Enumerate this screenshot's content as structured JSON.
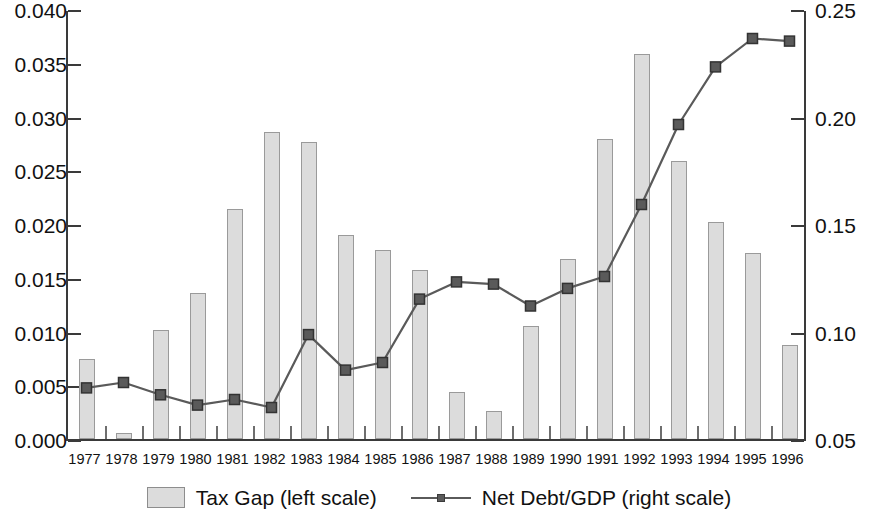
{
  "chart_data": {
    "type": "bar",
    "title": "",
    "subtitle": "",
    "xlabel": "",
    "ylabel": "",
    "grid": false,
    "legend_position": "bottom",
    "categories": [
      "1977",
      "1978",
      "1979",
      "1980",
      "1981",
      "1982",
      "1983",
      "1984",
      "1985",
      "1986",
      "1987",
      "1988",
      "1989",
      "1990",
      "1991",
      "1992",
      "1993",
      "1994",
      "1995",
      "1996"
    ],
    "axes": {
      "left": {
        "label": "",
        "ylim": [
          0.0,
          0.04
        ],
        "ticks": [
          0.0,
          0.005,
          0.01,
          0.015,
          0.02,
          0.025,
          0.03,
          0.035,
          0.04
        ],
        "tick_labels": [
          "0.000",
          "0.005",
          "0.010",
          "0.015",
          "0.020",
          "0.025",
          "0.030",
          "0.035",
          "0.040"
        ]
      },
      "right": {
        "label": "",
        "ylim": [
          0.05,
          0.25
        ],
        "ticks": [
          0.05,
          0.1,
          0.15,
          0.2,
          0.25
        ],
        "tick_labels": [
          "0.05",
          "0.10",
          "0.15",
          "0.20",
          "0.25"
        ]
      }
    },
    "series": [
      {
        "name": "Tax Gap (left scale)",
        "type": "bar",
        "axis": "left",
        "color": "#dcdcdc",
        "edge_color": "#9a9a9a",
        "values": [
          0.0074,
          0.0006,
          0.0101,
          0.0136,
          0.0214,
          0.0286,
          0.0276,
          0.019,
          0.0176,
          0.0157,
          0.0044,
          0.0026,
          0.0105,
          0.0167,
          0.0279,
          0.0358,
          0.0259,
          0.0202,
          0.0173,
          0.0087
        ]
      },
      {
        "name": "Net Debt/GDP (right scale)",
        "type": "line",
        "axis": "right",
        "color": "#5a5a5a",
        "marker": "square",
        "values": [
          0.0747,
          0.0772,
          0.0715,
          0.0667,
          0.0693,
          0.0656,
          0.0995,
          0.083,
          0.0865,
          0.116,
          0.124,
          0.123,
          0.1128,
          0.121,
          0.1265,
          0.16,
          0.1972,
          0.224,
          0.2372,
          0.236
        ]
      }
    ]
  },
  "legend": {
    "items": [
      {
        "label": "Tax Gap (left scale)",
        "kind": "swatch"
      },
      {
        "label": "Net Debt/GDP (right scale)",
        "kind": "line"
      }
    ]
  }
}
